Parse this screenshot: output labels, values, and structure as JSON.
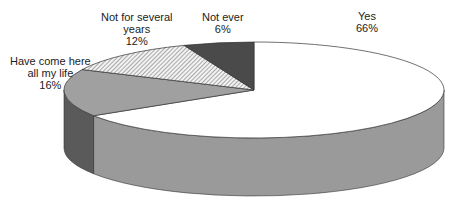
{
  "chart_data": {
    "type": "pie",
    "style": "3d-exploded-none",
    "title": "",
    "slices": [
      {
        "label": "Yes",
        "value": 66,
        "display": "66%",
        "fill": "#ffffff",
        "side": "#9a9a9a"
      },
      {
        "label": "Have come here all my life",
        "value": 16,
        "display": "16%",
        "fill": "#a0a0a0",
        "side": "#5a5a5a"
      },
      {
        "label": "Not for several years",
        "value": 12,
        "display": "12%",
        "fill": "hatch",
        "side": "#9a9a9a"
      },
      {
        "label": "Not ever",
        "value": 6,
        "display": "6%",
        "fill": "#4a4a4a",
        "side": "#333333"
      }
    ],
    "start_angle_deg": 0,
    "direction": "clockwise",
    "geometry": {
      "cx": 254,
      "cy": 90,
      "rx": 190,
      "ry": 48,
      "depth": 58
    }
  },
  "labels": {
    "yes": {
      "line1": "Yes",
      "line2": "66%"
    },
    "have_come": {
      "line1": "Have come here",
      "line2": "all my life",
      "line3": "16%"
    },
    "not_several": {
      "line1": "Not for several",
      "line2": "years",
      "line3": "12%"
    },
    "not_ever": {
      "line1": "Not ever",
      "line2": "6%"
    }
  }
}
